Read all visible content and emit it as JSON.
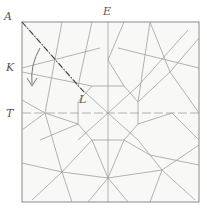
{
  "diagram": {
    "type": "origami-crease-pattern",
    "colors": {
      "paper": "#f7f7f5",
      "border": "#8a8a8a",
      "crease": "#9a9a9a",
      "label": "#555555",
      "fold_line": "#444444"
    },
    "labels": [
      {
        "id": "A",
        "text": "A",
        "x": 4,
        "y": 13
      },
      {
        "id": "E",
        "text": "E",
        "x": 103,
        "y": 7
      },
      {
        "id": "K",
        "text": "K",
        "x": 7,
        "y": 62
      },
      {
        "id": "T",
        "text": "T",
        "x": 7,
        "y": 108
      },
      {
        "id": "L",
        "text": "L",
        "x": 78,
        "y": 94
      }
    ],
    "square": {
      "x1": 22,
      "y1": 22,
      "x2": 199,
      "y2": 202
    },
    "annotations": {
      "dotted_fold": "A to L",
      "arrow": "curved arrow near K pointing down"
    }
  }
}
